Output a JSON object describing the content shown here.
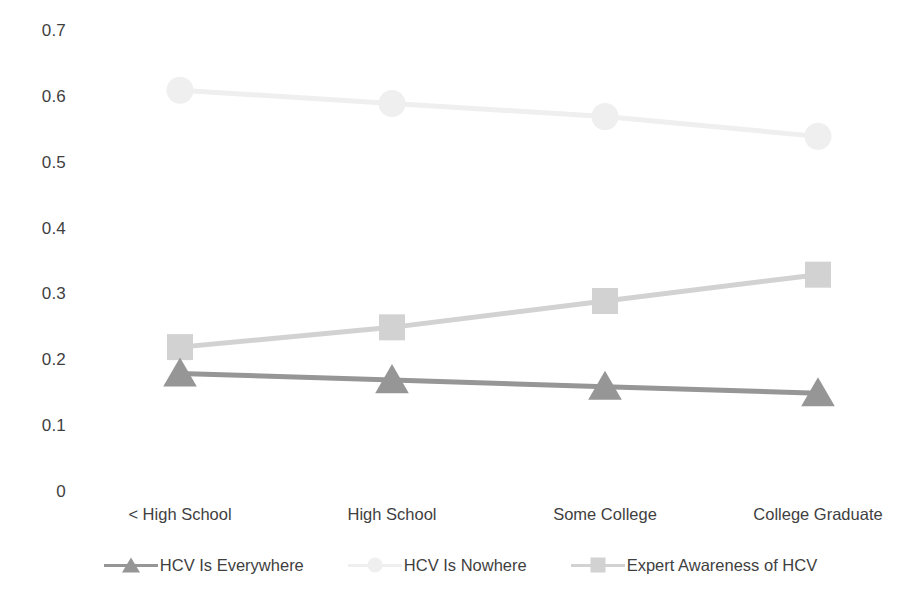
{
  "chart_data": {
    "type": "line",
    "title": "",
    "subtitle": "",
    "xlabel": "",
    "ylabel": "",
    "categories": [
      "< High School",
      "High School",
      "Some College",
      "College Graduate"
    ],
    "ylim": [
      0,
      0.7
    ],
    "yticks": [
      "0",
      "0.1",
      "0.2",
      "0.3",
      "0.4",
      "0.5",
      "0.6",
      "0.7"
    ],
    "ytick_values": [
      0,
      0.1,
      0.2,
      0.3,
      0.4,
      0.5,
      0.6,
      0.7
    ],
    "grid": false,
    "legend_position": "bottom",
    "series": [
      {
        "name": "HCV Is Everywhere",
        "marker": "triangle",
        "color": "#969696",
        "values": [
          0.18,
          0.17,
          0.16,
          0.15
        ]
      },
      {
        "name": "HCV Is Nowhere",
        "marker": "circle",
        "color": "#efefef",
        "values": [
          0.61,
          0.59,
          0.57,
          0.54
        ]
      },
      {
        "name": "Expert Awareness of HCV",
        "marker": "square",
        "color": "#d2d2d2",
        "values": [
          0.22,
          0.25,
          0.29,
          0.33
        ]
      }
    ]
  },
  "colors": {
    "background": "#ffffff",
    "text": "#3f3f3f",
    "series_everywhere": "#969696",
    "series_nowhere": "#efefef",
    "series_expert": "#d2d2d2"
  }
}
